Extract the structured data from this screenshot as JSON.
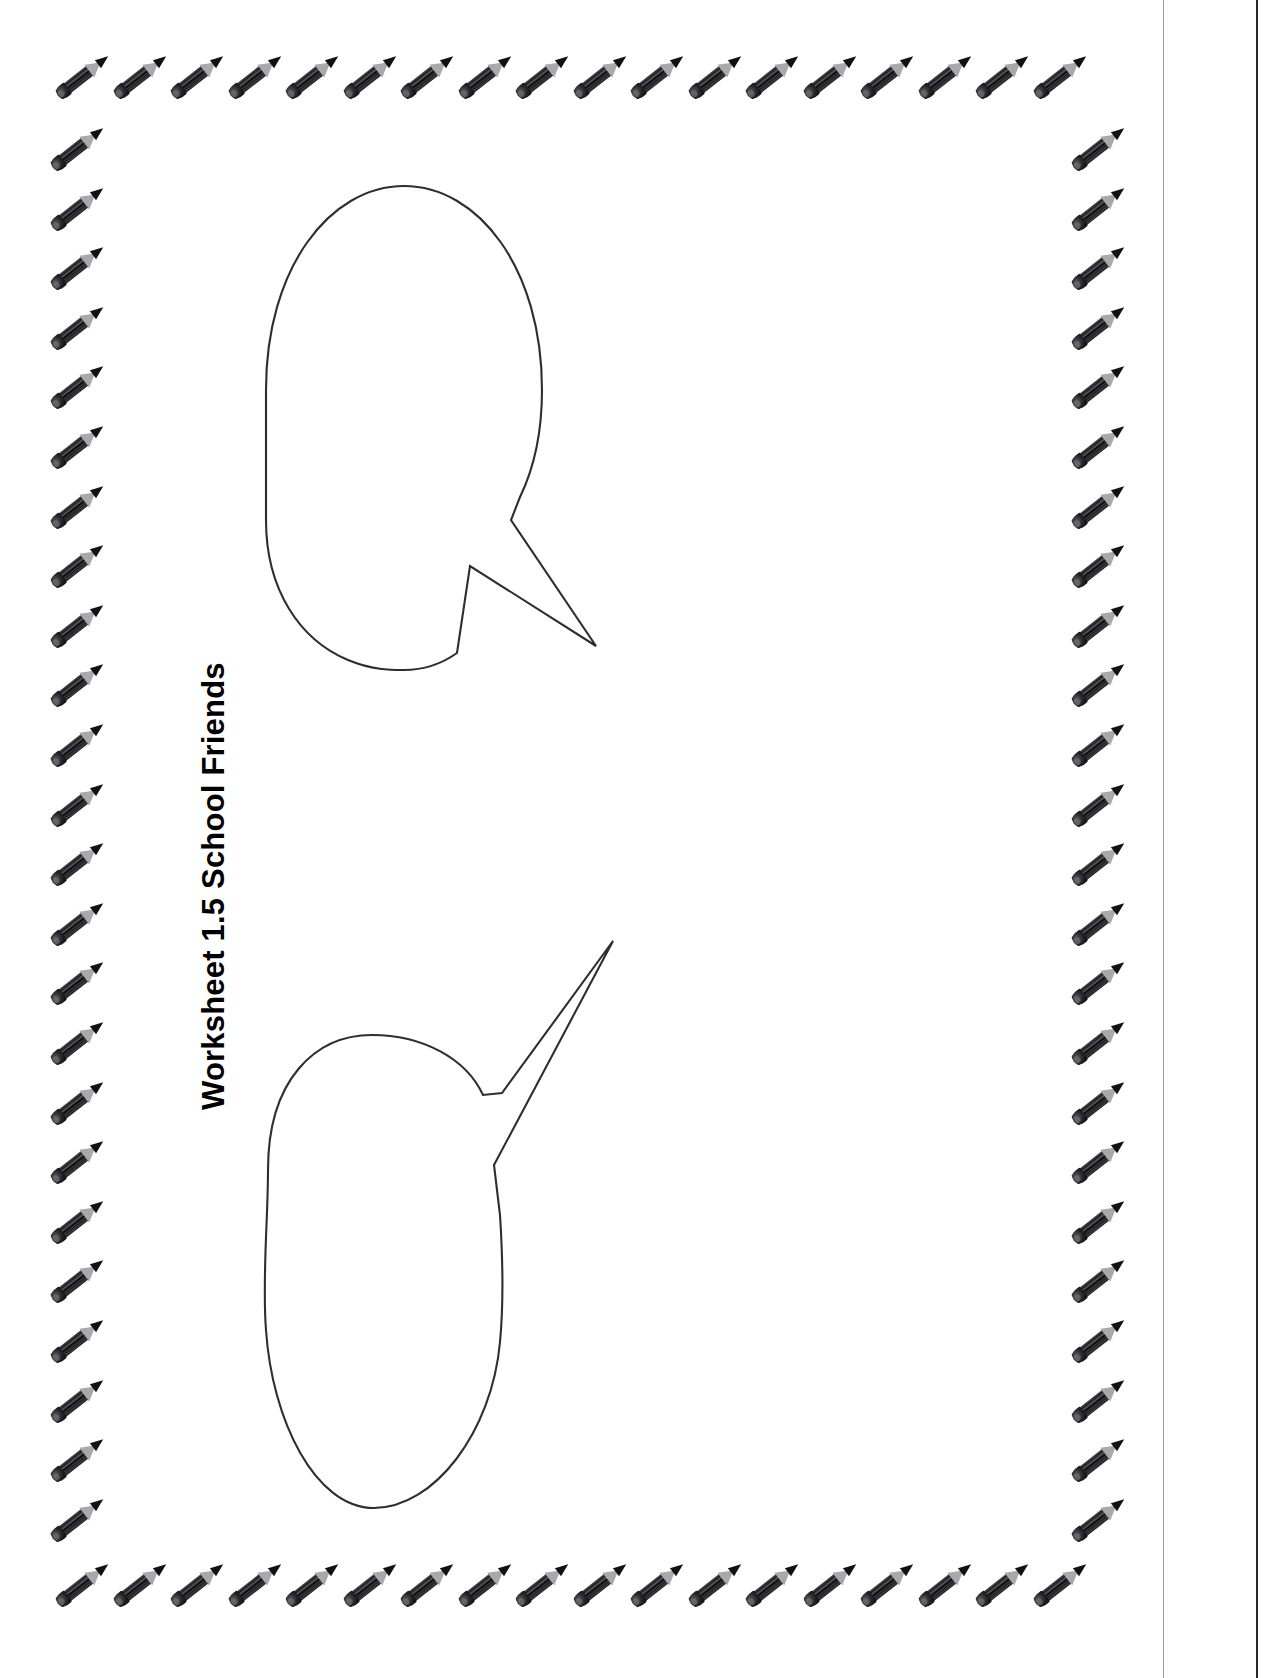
{
  "document": {
    "type": "worksheet",
    "title": "Worksheet 1.5 School Friends",
    "title_orientation": "rotated-90-ccw",
    "page_background": "#ffffff",
    "ink_color": "#2e2e2e"
  },
  "border": {
    "motif": "pencil-icon",
    "motif_label": "pencil",
    "colors": {
      "barrel": "#14141 6",
      "wood": "#a9a9ad",
      "graphite": "#111114"
    },
    "top_row_count": 18,
    "bottom_row_count": 18,
    "left_column_count": 24,
    "right_column_count": 24
  },
  "bubbles": [
    {
      "name": "speech-bubble-top",
      "shape": "oval-with-tail",
      "tail_direction": "down-right",
      "content": ""
    },
    {
      "name": "speech-bubble-bottom",
      "shape": "oval-with-tail",
      "tail_direction": "up-right",
      "content": ""
    }
  ],
  "scan_artifacts": {
    "right_edge_line": true,
    "right_inner_line": true
  }
}
